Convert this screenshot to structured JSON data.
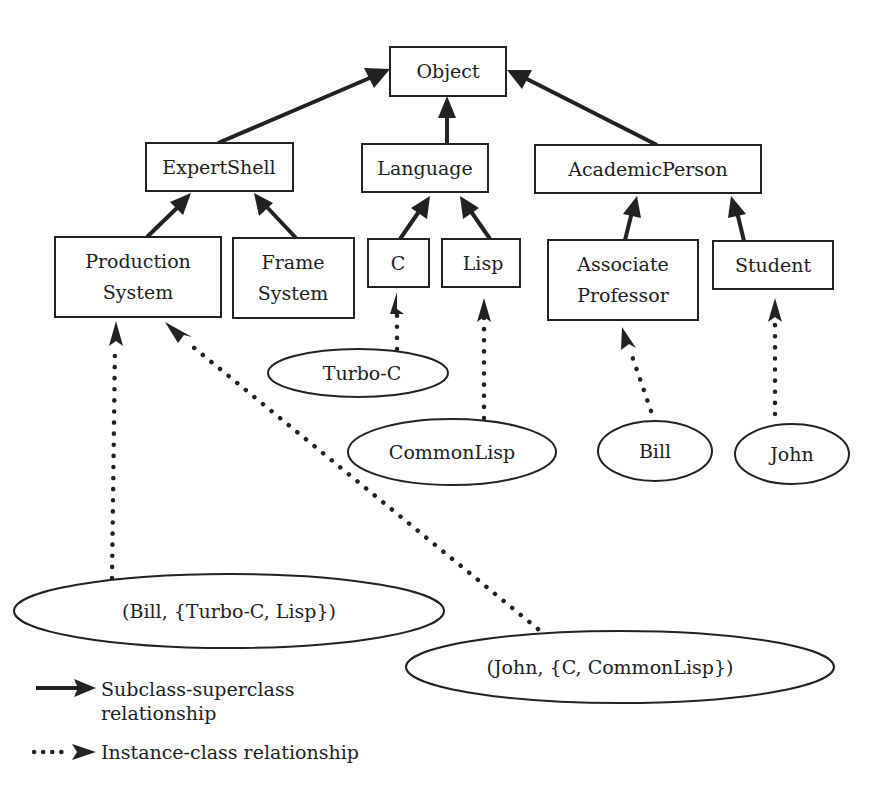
{
  "diagram": {
    "type": "class-hierarchy",
    "classes": {
      "object": {
        "label": "Object"
      },
      "expertshell": {
        "label": "ExpertShell"
      },
      "language": {
        "label": "Language"
      },
      "academicperson": {
        "label": "AcademicPerson"
      },
      "production_system": {
        "line1": "Production",
        "line2": "System"
      },
      "frame_system": {
        "line1": "Frame",
        "line2": "System"
      },
      "c": {
        "label": "C"
      },
      "lisp": {
        "label": "Lisp"
      },
      "associate_professor": {
        "line1": "Associate",
        "line2": "Professor"
      },
      "student": {
        "label": "Student"
      }
    },
    "instances": {
      "turbo_c": {
        "label": "Turbo-C"
      },
      "commonlisp": {
        "label": "CommonLisp"
      },
      "bill": {
        "label": "Bill"
      },
      "john": {
        "label": "John"
      },
      "bill_pair": {
        "label": "(Bill, {Turbo-C, Lisp})"
      },
      "john_pair": {
        "label": "(John, {C, CommonLisp})"
      }
    },
    "edges": [
      {
        "from": "ExpertShell",
        "to": "Object",
        "kind": "subclass"
      },
      {
        "from": "Language",
        "to": "Object",
        "kind": "subclass"
      },
      {
        "from": "AcademicPerson",
        "to": "Object",
        "kind": "subclass"
      },
      {
        "from": "Production System",
        "to": "ExpertShell",
        "kind": "subclass"
      },
      {
        "from": "Frame System",
        "to": "ExpertShell",
        "kind": "subclass"
      },
      {
        "from": "C",
        "to": "Language",
        "kind": "subclass"
      },
      {
        "from": "Lisp",
        "to": "Language",
        "kind": "subclass"
      },
      {
        "from": "Associate Professor",
        "to": "AcademicPerson",
        "kind": "subclass"
      },
      {
        "from": "Student",
        "to": "AcademicPerson",
        "kind": "subclass"
      },
      {
        "from": "Turbo-C",
        "to": "C",
        "kind": "instance"
      },
      {
        "from": "CommonLisp",
        "to": "Lisp",
        "kind": "instance"
      },
      {
        "from": "Bill",
        "to": "Associate Professor",
        "kind": "instance"
      },
      {
        "from": "John",
        "to": "Student",
        "kind": "instance"
      },
      {
        "from": "(Bill, {Turbo-C, Lisp})",
        "to": "Production System",
        "kind": "instance"
      },
      {
        "from": "(John, {C, CommonLisp})",
        "to": "Production System",
        "kind": "instance"
      }
    ]
  },
  "legend": {
    "solid": {
      "line1": "Subclass-superclass",
      "line2": "relationship"
    },
    "dotted": {
      "label": "Instance-class relationship"
    }
  },
  "colors": {
    "ink": "#222222",
    "background": "#ffffff"
  }
}
